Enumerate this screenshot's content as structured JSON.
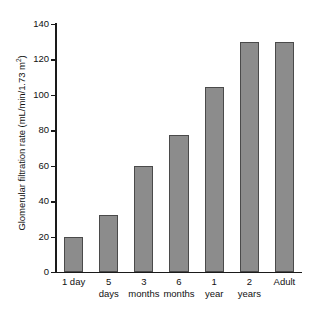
{
  "chart_data": {
    "type": "bar",
    "title": "",
    "xlabel": "",
    "ylabel": "Glomerular filtration rate (mL/min/1.73 m2)",
    "ylabel_parts": {
      "main": "Glomerular filtration rate (mL/min/1.73 m",
      "superscript": "2",
      "tail": ")"
    },
    "categories": [
      "1 day",
      "5 days",
      "3 months",
      "6 months",
      "1 year",
      "2 years",
      "Adult"
    ],
    "category_lines": [
      [
        "1 day"
      ],
      [
        "5",
        "days"
      ],
      [
        "3",
        "months"
      ],
      [
        "6",
        "months"
      ],
      [
        "1",
        "year"
      ],
      [
        "2",
        "years"
      ],
      [
        "Adult"
      ]
    ],
    "values": [
      20,
      32,
      60,
      77.5,
      104.5,
      130,
      130
    ],
    "ylim": [
      0,
      140
    ],
    "yticks": [
      0,
      20,
      40,
      60,
      80,
      100,
      120,
      140
    ],
    "ytick_labels": [
      "0",
      "20",
      "40",
      "60",
      "80",
      "100",
      "120",
      "140"
    ],
    "grid": false,
    "legend": false,
    "legend_position": "none",
    "bar_fill_color": "#8c8c8c",
    "bar_edge_color": "#4a4a4a",
    "axis_color": "#1a1a1a",
    "background_color": "#ffffff"
  }
}
